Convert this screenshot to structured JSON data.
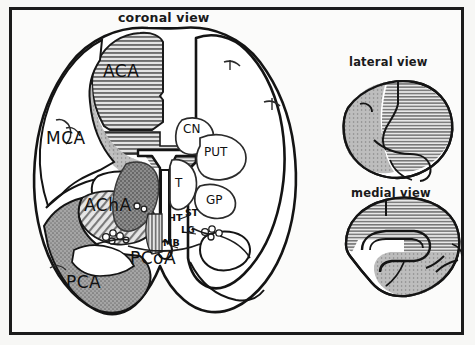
{
  "figure": {
    "domain": "anatomical-diagram",
    "border_color": "#1b1b1b",
    "background_color": "#fbfbfa",
    "ink_color": "#111111"
  },
  "panels": [
    {
      "id": "coronal",
      "title": "coronal view"
    },
    {
      "id": "lateral",
      "title": "lateral view"
    },
    {
      "id": "medial",
      "title": "medial view"
    }
  ],
  "titles": {
    "coronal": "coronal view",
    "lateral": "lateral view",
    "medial": "medial view"
  },
  "vascular_territories": [
    {
      "abbr": "ACA",
      "fill": "horizontal-hatch",
      "color": "#9d9d9d"
    },
    {
      "abbr": "MCA",
      "fill": "none",
      "color": "#ffffff"
    },
    {
      "abbr": "AChA",
      "fill": "diagonal-hatch",
      "color": "#a8a8a8"
    },
    {
      "abbr": "PCA",
      "fill": "stipple-gray",
      "color": "#9a9a9a"
    },
    {
      "abbr": "PCoA",
      "fill": "vertical-hatch",
      "color": "#8f8f8f"
    }
  ],
  "structures": [
    {
      "abbr": "CN",
      "x": 190,
      "y": 128
    },
    {
      "abbr": "PUT",
      "x": 208,
      "y": 152
    },
    {
      "abbr": "T",
      "x": 176,
      "y": 183
    },
    {
      "abbr": "GP",
      "x": 212,
      "y": 199
    },
    {
      "abbr": "HT",
      "x": 171,
      "y": 218
    },
    {
      "abbr": "ST",
      "x": 188,
      "y": 214
    },
    {
      "abbr": "LG",
      "x": 186,
      "y": 231
    },
    {
      "abbr": "MB",
      "x": 168,
      "y": 243
    }
  ],
  "labels": {
    "aca": "ACA",
    "mca": "MCA",
    "acha": "AChA",
    "pca": "PCA",
    "pcoa": "PCoA",
    "cn": "CN",
    "put": "PUT",
    "t": "T",
    "gp": "GP",
    "ht": "HT",
    "st": "ST",
    "lg": "LG",
    "mb": "MB"
  }
}
